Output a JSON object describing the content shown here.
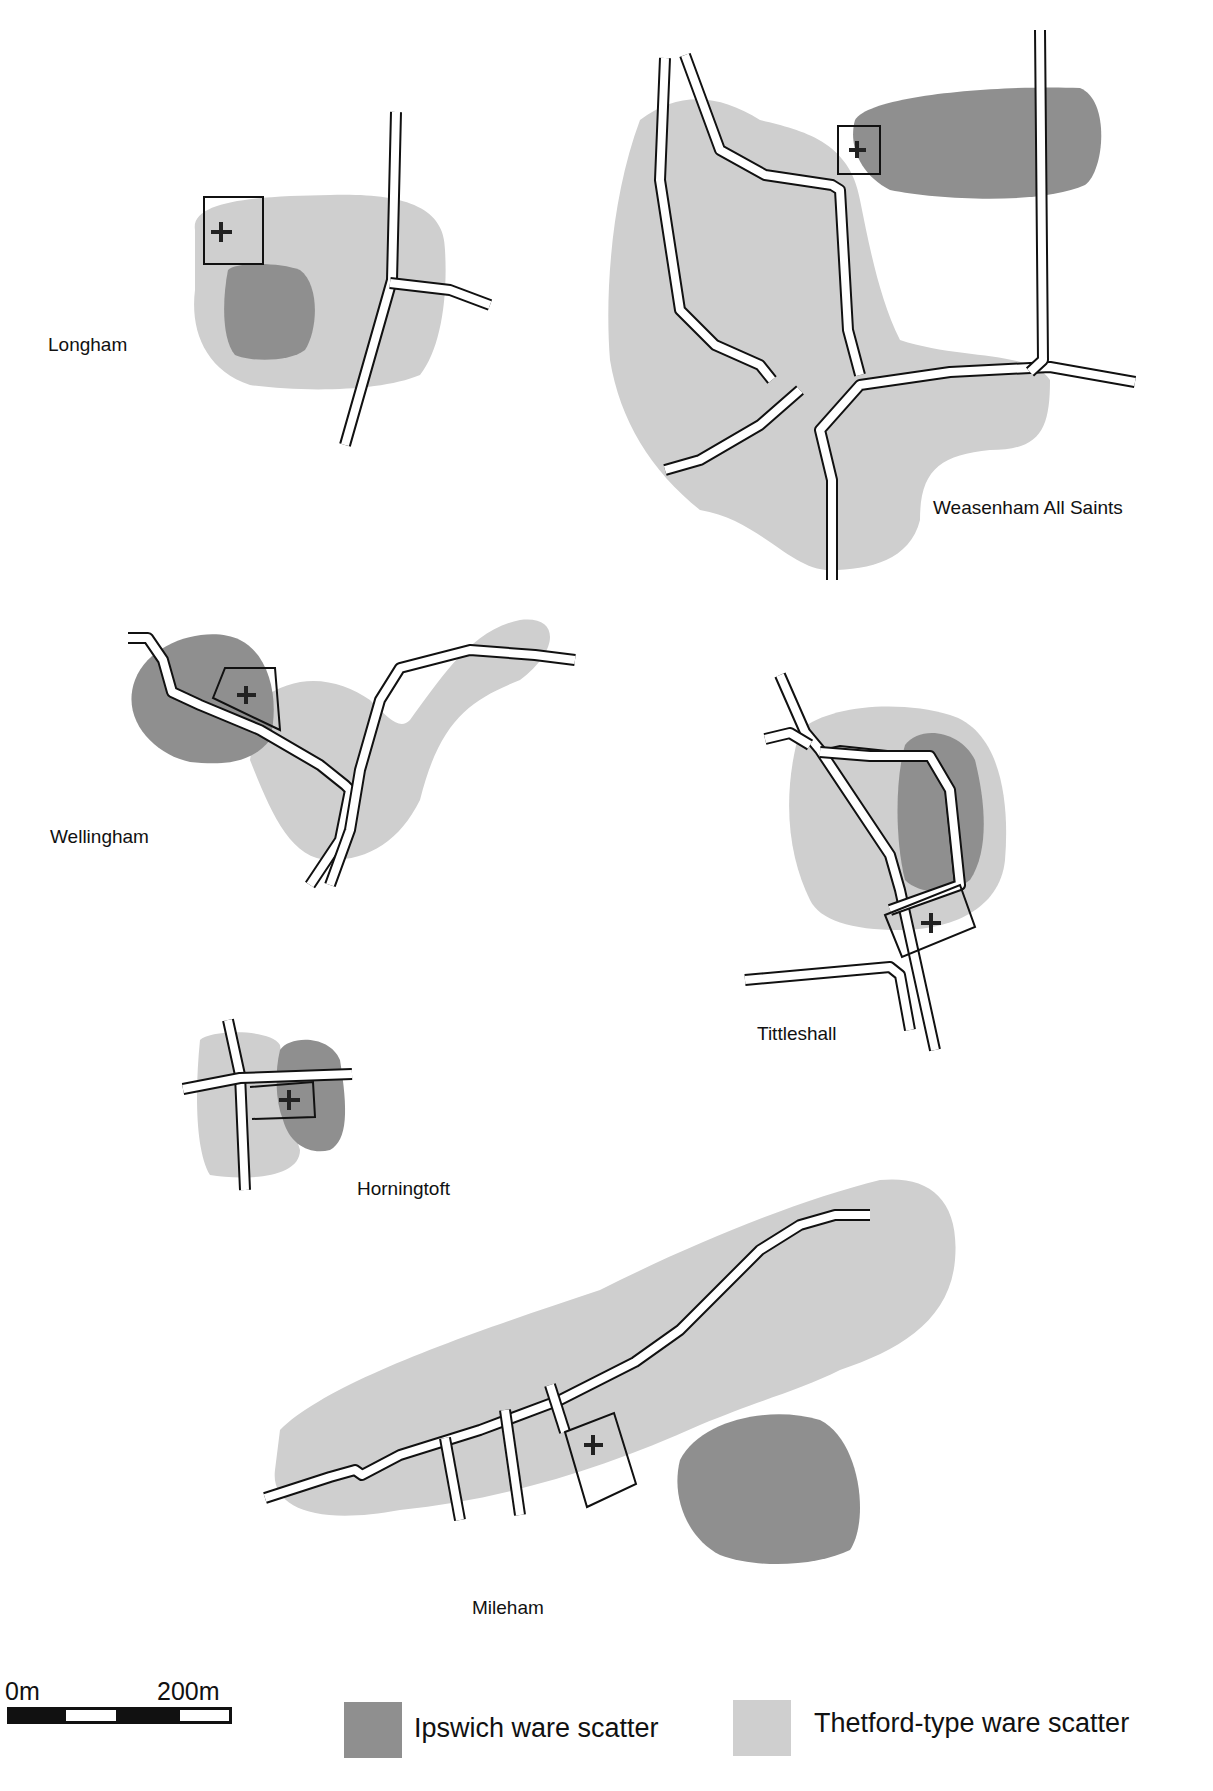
{
  "colors": {
    "ipswich": "#8f8f8f",
    "thetford": "#cfcfcf",
    "road_edge": "#111111",
    "road_fill": "#ffffff"
  },
  "sites": [
    {
      "name": "Longham"
    },
    {
      "name": "Weasenham All Saints"
    },
    {
      "name": "Wellingham"
    },
    {
      "name": "Tittleshall"
    },
    {
      "name": "Horningtoft"
    },
    {
      "name": "Mileham"
    }
  ],
  "legend": {
    "items": [
      {
        "label": "Ipswich ware scatter",
        "color": "#8f8f8f"
      },
      {
        "label": "Thetford-type ware scatter",
        "color": "#cfcfcf"
      }
    ]
  },
  "scale_bar": {
    "start_label": "0m",
    "end_label": "200m"
  },
  "markers": {
    "church_symbol": "+"
  }
}
